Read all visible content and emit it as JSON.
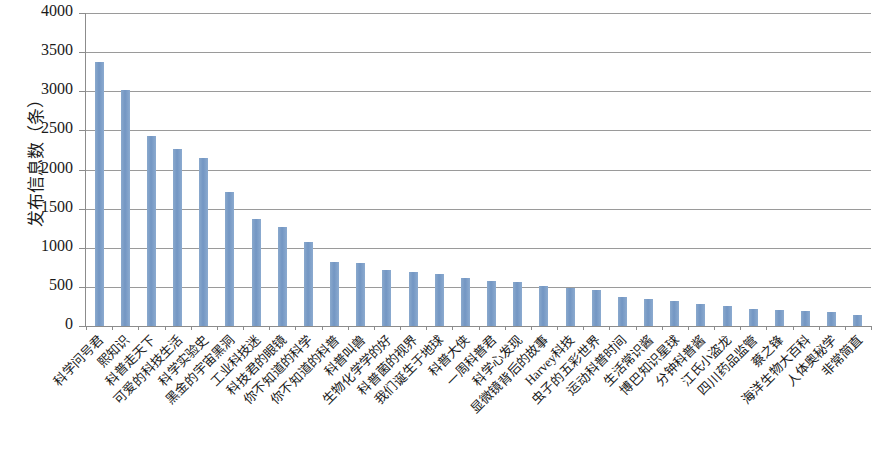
{
  "chart_data": {
    "type": "bar",
    "title": "",
    "xlabel": "",
    "ylabel": "发布信息数（条）",
    "ylim": [
      0,
      4000
    ],
    "ytick_step": 500,
    "ytick_labels": [
      "4000",
      "3500",
      "3000",
      "2500",
      "2000",
      "1500",
      "1000",
      "500",
      "0"
    ],
    "ytick_values": [
      4000,
      3500,
      3000,
      2500,
      2000,
      1500,
      1000,
      500,
      0
    ],
    "grid": true,
    "legend": null,
    "bar_color": "#7d9fc8",
    "axis_color": "#8c8c8c",
    "categories": [
      "科学问号君",
      "熙知识",
      "科普走天下",
      "可爱的科技生活",
      "科学实验史",
      "黑金的宇宙黑洞",
      "工业科技迷",
      "科技君的眼镜",
      "你不知道的科学",
      "你不知道的科普",
      "科普叫兽",
      "生物化学学的好",
      "科普菌的视界",
      "我们诞生于地球",
      "科普大侠",
      "一周科普君",
      "科学心发现",
      "显微镜背后的故事",
      "Harvey科技",
      "虫子的五彩世界",
      "运动科普时间",
      "生活常识酱",
      "博巴知识星球",
      "分钟科普酱",
      "江氏小盗龙",
      "四川药品监管",
      "蔡之锋",
      "海洋生物大百科",
      "人体奥秘学",
      "非常简直"
    ],
    "values": [
      3370,
      3010,
      2430,
      2260,
      2150,
      1710,
      1370,
      1260,
      1070,
      820,
      810,
      710,
      690,
      660,
      620,
      570,
      560,
      510,
      490,
      460,
      370,
      340,
      320,
      280,
      260,
      220,
      210,
      195,
      180,
      135
    ]
  }
}
